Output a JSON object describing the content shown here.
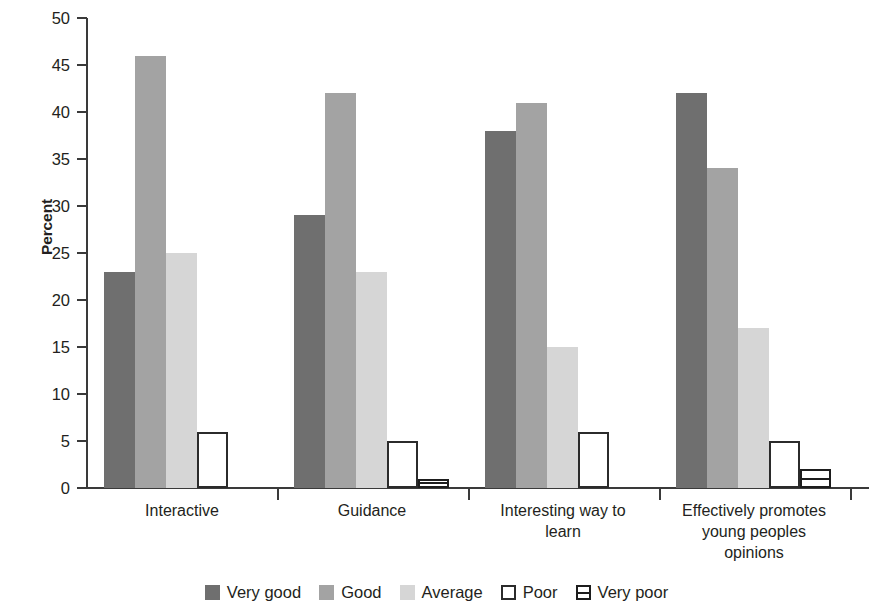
{
  "chart_data": {
    "type": "bar",
    "title": "",
    "subtitle": "",
    "xlabel": "",
    "ylabel": "Percent",
    "ylim": [
      0,
      50
    ],
    "ytick_labels": [
      "50",
      "45",
      "40",
      "35",
      "30",
      "25",
      "20",
      "15",
      "10",
      "5",
      "0"
    ],
    "ytick_values": [
      50,
      45,
      40,
      35,
      30,
      25,
      20,
      15,
      10,
      5,
      0
    ],
    "grid": false,
    "legend_position": "bottom",
    "categories": [
      "Interactive",
      "Guidance",
      "Interesting way to\nlearn",
      "Effectively promotes\nyoung peoples\nopinions"
    ],
    "category_lines": [
      [
        "Interactive"
      ],
      [
        "Guidance"
      ],
      [
        "Interesting way to",
        "learn"
      ],
      [
        "Effectively promotes",
        "young peoples",
        "opinions"
      ]
    ],
    "series": [
      {
        "name": "Very good",
        "color": "#6f6f6f",
        "style": "solid",
        "values": [
          23,
          29,
          38,
          42
        ]
      },
      {
        "name": "Good",
        "color": "#a3a3a3",
        "style": "solid",
        "values": [
          46,
          42,
          41,
          34
        ]
      },
      {
        "name": "Average",
        "color": "#d6d6d6",
        "style": "solid",
        "values": [
          25,
          23,
          15,
          17
        ]
      },
      {
        "name": "Poor",
        "color": "#ffffff",
        "style": "outline",
        "values": [
          6,
          5,
          6,
          5
        ]
      },
      {
        "name": "Very poor",
        "color": "#ffffff",
        "style": "horizontal-stripe",
        "values": [
          0,
          1,
          0,
          2
        ]
      }
    ]
  },
  "legend": {
    "items": [
      {
        "label": "Very good",
        "swatch": "legend-swatch-very-good"
      },
      {
        "label": "Good",
        "swatch": "legend-swatch-good"
      },
      {
        "label": "Average",
        "swatch": "legend-swatch-average"
      },
      {
        "label": "Poor",
        "swatch": "legend-swatch-poor"
      },
      {
        "label": "Very poor",
        "swatch": "legend-swatch-very-poor"
      }
    ]
  },
  "axis": {
    "y_title": "Percent"
  }
}
